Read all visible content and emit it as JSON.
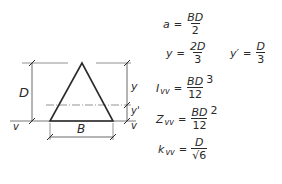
{
  "diagram": {
    "labels": {
      "D": "D",
      "B": "B",
      "y": "y",
      "y_prime": "y'",
      "v_left": "v",
      "v_right": "v"
    },
    "line_color": "#2a2a2a",
    "centroid_line_color": "#555555"
  },
  "formulas": [
    {
      "lhs": "a",
      "sub": "",
      "num": "BD",
      "den": "2",
      "pow": ""
    },
    {
      "lhs": "y",
      "sub": "",
      "num": "2D",
      "den": "3",
      "pow": ""
    },
    {
      "lhs": "y′",
      "sub": "",
      "num": "D",
      "den": "3",
      "pow": ""
    },
    {
      "lhs": "I",
      "sub": "vv",
      "num": "BD",
      "den": "12",
      "pow": "3"
    },
    {
      "lhs": "Z",
      "sub": "vv",
      "num": "BD",
      "den": "12",
      "pow": "2"
    },
    {
      "lhs": "k",
      "sub": "vv",
      "num": "D",
      "den": "√6",
      "pow": ""
    }
  ],
  "equals": "="
}
